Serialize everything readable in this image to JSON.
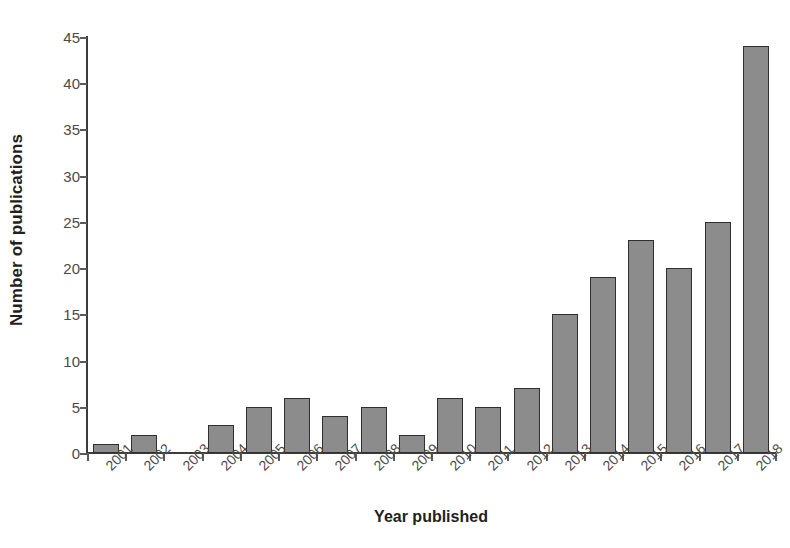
{
  "chart_data": {
    "type": "bar",
    "title": "",
    "xlabel": "Year published",
    "ylabel": "Number of publications",
    "categories": [
      "2001",
      "2002",
      "2003",
      "2004",
      "2005",
      "2006",
      "2007",
      "2008",
      "2009",
      "2010",
      "2011",
      "2012",
      "2013",
      "2014",
      "2015",
      "2016",
      "2017",
      "2018"
    ],
    "values": [
      1,
      2,
      0,
      3,
      5,
      6,
      4,
      5,
      2,
      6,
      5,
      7,
      15,
      19,
      23,
      20,
      25,
      44
    ],
    "ylim": [
      0,
      45
    ],
    "ytick_labels": [
      "0",
      "5",
      "10",
      "15",
      "20",
      "25",
      "30",
      "35",
      "40",
      "45"
    ],
    "ytick_values": [
      0,
      5,
      10,
      15,
      20,
      25,
      30,
      35,
      40,
      45
    ],
    "grid": false,
    "legend": false,
    "bar_color": "#8c8c8c",
    "bar_edge_color": "#2f2f2f",
    "axis_color": "#3c3c3c",
    "tick_label_color": "#4a4a4a",
    "title_color": "#231f20",
    "background": "#ffffff",
    "xtick_label_rotation": -45
  }
}
